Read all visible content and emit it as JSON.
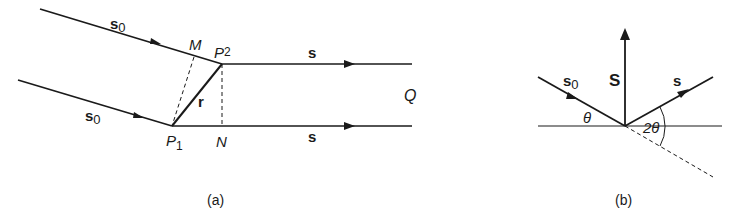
{
  "panel_a": {
    "caption": "(a)",
    "incident_upper_label": "s",
    "incident_upper_sub": "0",
    "incident_lower_label": "s",
    "incident_lower_sub": "0",
    "point_m": "M",
    "point_p2": "P",
    "point_p2_sub": "2",
    "point_p1": "P",
    "point_p1_sub": "1",
    "point_n": "N",
    "vector_r": "r",
    "scattered_upper_label": "s",
    "scattered_lower_label": "s",
    "point_q": "Q"
  },
  "panel_b": {
    "caption": "(b)",
    "incident_label": "s",
    "incident_sub": "0",
    "scattering_vector_label": "S",
    "scattered_label": "s",
    "angle_theta": "θ",
    "angle_two_theta": "2θ"
  },
  "colors": {
    "ink": "#1a1a1a",
    "background": "#ffffff"
  }
}
